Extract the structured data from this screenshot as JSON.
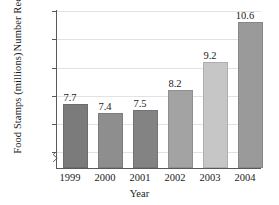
{
  "chart_data": {
    "type": "bar",
    "title": "",
    "subtitle": "",
    "xlabel": "Year",
    "ylabel": "Number Receiving Food Stamps (millions)",
    "ylabel_lines": [
      "Number Receiving",
      "Food Stamps (millions)"
    ],
    "categories": [
      "1999",
      "2000",
      "2001",
      "2002",
      "2003",
      "2004"
    ],
    "values": [
      7.7,
      7.5,
      7.4,
      8.2,
      9.2,
      10.6
    ],
    "series": [
      {
        "name": "Number Receiving Food Stamps (millions)",
        "values": [
          7.7,
          7.4,
          7.5,
          8.2,
          9.2,
          10.6
        ]
      }
    ],
    "data_labels": [
      "7.7",
      "7.4",
      "7.5",
      "8.2",
      "9.2",
      "10.6"
    ],
    "ylim": [
      5.45,
      11
    ],
    "yticks": [
      6,
      7,
      8,
      9,
      10,
      11
    ],
    "ytick_labels": [
      "6",
      "7",
      "8",
      "9",
      "10",
      "11"
    ],
    "grid": "horizontal",
    "legend": "none",
    "axis_break": true,
    "bar_colors": [
      "#7b7b7b",
      "#8e8e8e",
      "#838383",
      "#a3a3a3",
      "#c6c6c6",
      "#9a9a9a"
    ],
    "axis_color": "#59595d",
    "grid_color": "#e2e2e6",
    "background": "#ffffff",
    "text_color": "#1a1a1a"
  }
}
